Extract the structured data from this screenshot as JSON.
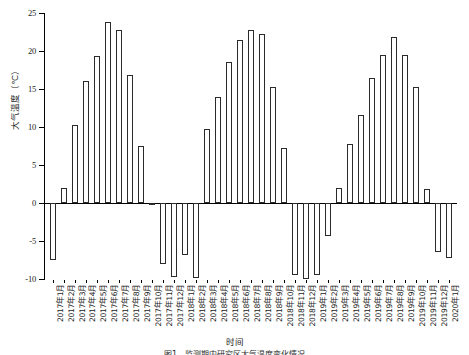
{
  "chart_data": {
    "type": "bar",
    "title": "",
    "xlabel": "时间",
    "ylabel": "大气温度（℃）",
    "ylim": [
      -10,
      25
    ],
    "yticks": [
      -10,
      -5,
      0,
      5,
      10,
      15,
      20,
      25
    ],
    "ytick_labels": [
      "-10",
      "-5",
      "0",
      "5",
      "10",
      "15",
      "20",
      "25"
    ],
    "grid": false,
    "legend": null,
    "bar_color": "#ffffff",
    "bar_edge_color": "#2b2b2b",
    "axis_color": "#000000",
    "categories": [
      "2017年1月",
      "2017年2月",
      "2017年3月",
      "2017年4月",
      "2017年5月",
      "2017年6月",
      "2017年7月",
      "2017年8月",
      "2017年9月",
      "2017年10月",
      "2017年11月",
      "2017年12月",
      "2018年1月",
      "2018年2月",
      "2018年3月",
      "2018年4月",
      "2018年5月",
      "2018年6月",
      "2018年7月",
      "2018年8月",
      "2018年9月",
      "2018年10月",
      "2018年11月",
      "2018年12月",
      "2019年1月",
      "2019年2月",
      "2019年3月",
      "2019年4月",
      "2019年5月",
      "2019年6月",
      "2019年7月",
      "2019年8月",
      "2019年9月",
      "2019年10月",
      "2019年11月",
      "2019年12月",
      "2020年1月"
    ],
    "values": [
      -7.5,
      2.0,
      10.3,
      16.0,
      19.4,
      23.8,
      22.7,
      16.8,
      7.5,
      -0.3,
      -8.0,
      -9.8,
      -6.8,
      -9.9,
      9.8,
      14.0,
      18.5,
      21.5,
      22.8,
      22.3,
      15.3,
      7.2,
      -9.5,
      -10.0,
      -9.5,
      -4.3,
      2.0,
      7.8,
      11.6,
      16.5,
      19.5,
      21.8,
      19.5,
      15.3,
      1.8,
      -6.5,
      -7.3
    ]
  },
  "figure": {
    "caption": "图1　监测期内研究区大气温度变化情况"
  }
}
